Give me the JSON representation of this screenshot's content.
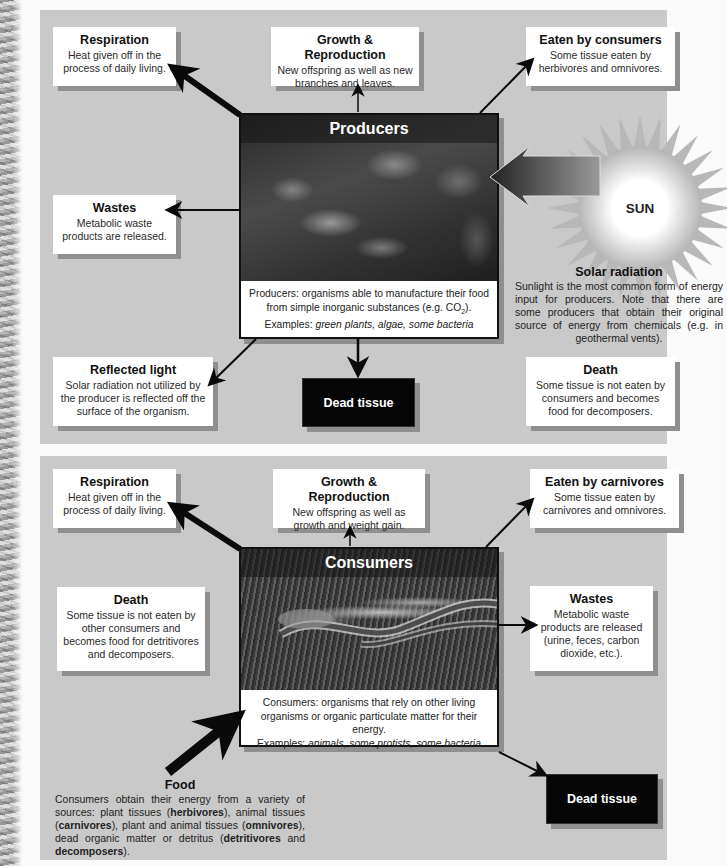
{
  "producers_panel": {
    "organism": {
      "title": "Producers",
      "caption_line1": "Producers: organisms able to manufacture their food",
      "caption_line2_pre": "from simple inorganic substances (e.g. CO",
      "caption_line2_sub": "2",
      "caption_line2_post": ").",
      "examples_label": "Examples: ",
      "examples": "green plants, algae, some bacteria"
    },
    "respiration": {
      "title": "Respiration",
      "desc": "Heat given off in the process of daily living."
    },
    "growth": {
      "title": "Growth & Reproduction",
      "desc": "New offspring as well as new branches and leaves."
    },
    "eaten": {
      "title": "Eaten by consumers",
      "desc": "Some tissue eaten by herbivores and omnivores."
    },
    "wastes": {
      "title": "Wastes",
      "desc": "Metabolic waste products are released."
    },
    "sun": {
      "label": "SUN"
    },
    "solar": {
      "title": "Solar radiation",
      "desc": "Sunlight is the most common form of energy input for producers. Note that there are some producers that obtain their original source of energy from chemicals (e.g. in geothermal vents)."
    },
    "reflected": {
      "title": "Reflected light",
      "desc": "Solar radiation not utilized by the producer is reflected off the surface of the organism."
    },
    "dead_tissue": {
      "label": "Dead tissue"
    },
    "death": {
      "title": "Death",
      "desc": "Some tissue is not eaten by consumers and becomes food for decomposers."
    }
  },
  "consumers_panel": {
    "organism": {
      "title": "Consumers",
      "caption_line1": "Consumers: organisms that rely on other living",
      "caption_line2": "organisms or organic particulate matter for their energy.",
      "examples_label": "Examples: ",
      "examples": "animals, some protists, some bacteria"
    },
    "respiration": {
      "title": "Respiration",
      "desc": "Heat given off in the process of daily living."
    },
    "growth": {
      "title": "Growth & Reproduction",
      "desc": "New offspring as well as growth and weight gain."
    },
    "eaten": {
      "title": "Eaten by carnivores",
      "desc": "Some tissue eaten by carnivores and omnivores."
    },
    "death": {
      "title": "Death",
      "desc": "Some tissue is not eaten by other consumers and becomes food for detritivores and decomposers."
    },
    "wastes": {
      "title": "Wastes",
      "desc": "Metabolic waste products are released (urine, feces, carbon dioxide, etc.)."
    },
    "food": {
      "title": "Food",
      "desc_1": "Consumers obtain their energy from a variety of sources: plant tissues (",
      "herbivores": "herbivores",
      "desc_2": "), animal tissues (",
      "carnivores": "carnivores",
      "desc_3": "), plant and animal tissues (",
      "omnivores": "omnivores",
      "desc_4": "), dead organic matter or detritus (",
      "detritivores": "detritivores",
      "desc_5": " and ",
      "decomposers": "decomposers",
      "desc_6": ")."
    },
    "dead_tissue": {
      "label": "Dead tissue"
    }
  },
  "colors": {
    "panel_bg": "#c9c9c9",
    "box_bg": "#ffffff",
    "box_shadow": "#8f8f8f",
    "arrow": "#0a0a0a",
    "dead_tissue_bg": "#050505"
  }
}
